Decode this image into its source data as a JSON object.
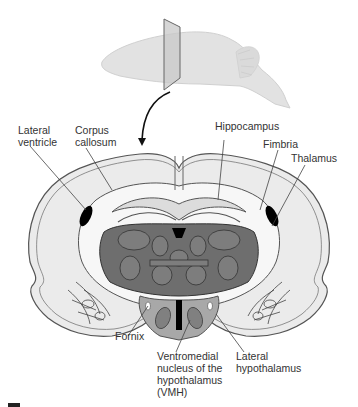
{
  "figure": {
    "type": "coronal brain section diagram",
    "inset": "whole rodent brain with coronal cutting plane",
    "scale_bar": true
  },
  "labels": {
    "lateral_ventricle": [
      "Lateral",
      "ventricle"
    ],
    "corpus_callosum": [
      "Corpus",
      "callosum"
    ],
    "hippocampus": [
      "Hippocampus"
    ],
    "fimbria": [
      "Fimbria"
    ],
    "thalamus": [
      "Thalamus"
    ],
    "fornix": [
      "Fornix"
    ],
    "vmh": [
      "Ventromedial",
      "nucleus of the",
      "hypothalamus",
      "(VMH)"
    ],
    "lateral_hypothalamus": [
      "Lateral",
      "hypothalamus"
    ]
  },
  "colors": {
    "outline": "#555555",
    "cortex_fill": "#ebebeb",
    "white_matter": "#f7f7f7",
    "thalamus_fill": "#6e6e6e",
    "thalamus_nuclei": "#7d7d7d",
    "hypothalamus_fill": "#a8a8a8",
    "ventricle": "#000000",
    "label_text": "#333333"
  }
}
